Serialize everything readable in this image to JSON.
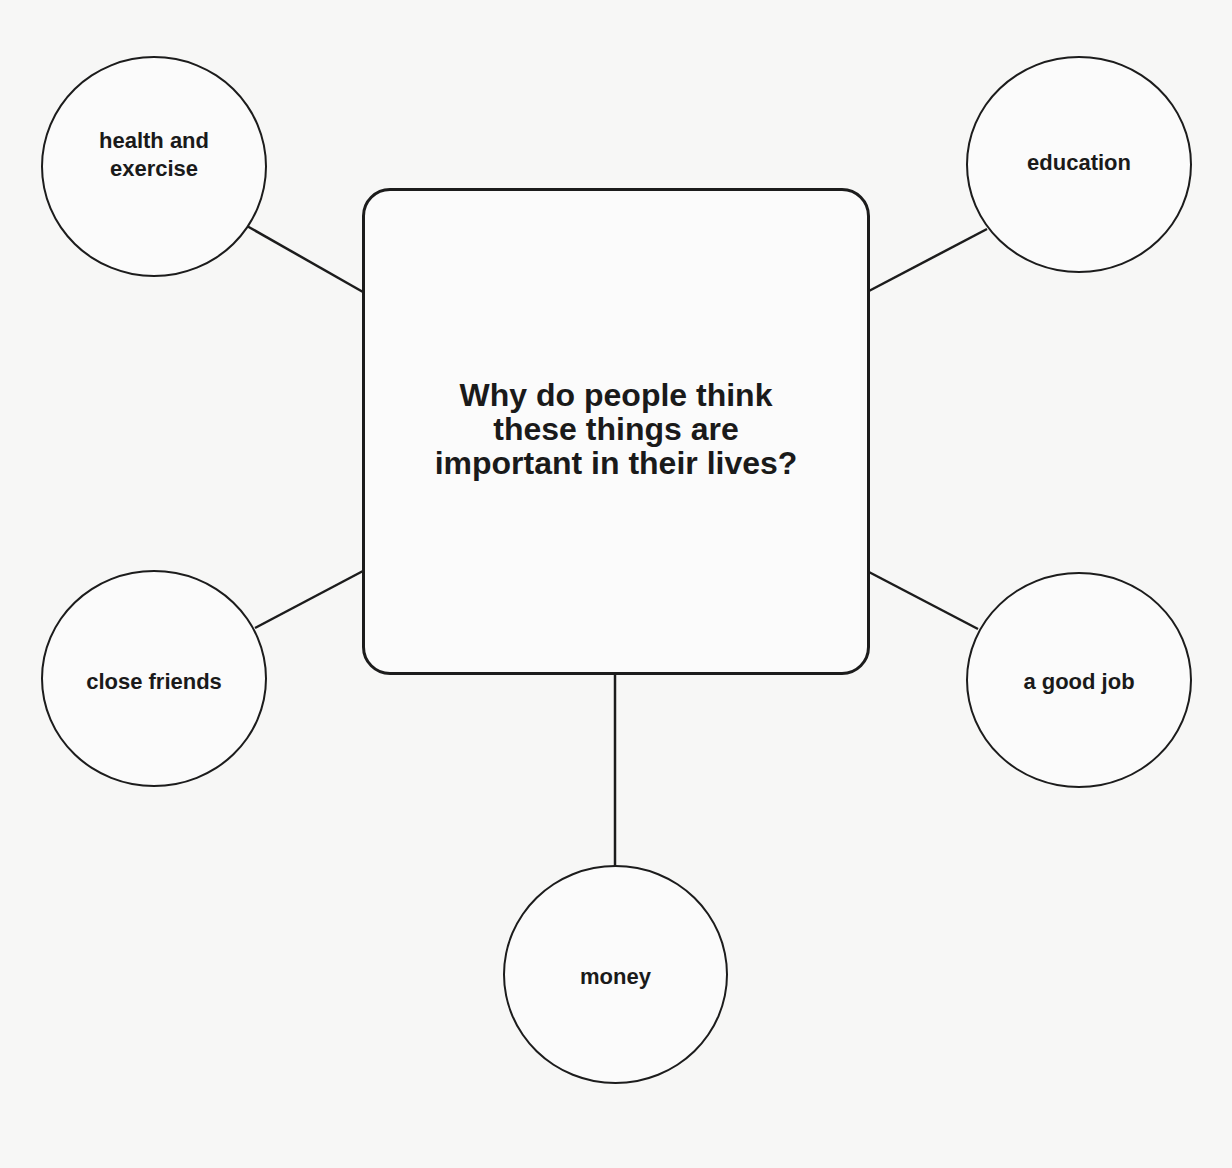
{
  "diagram": {
    "type": "mind-map",
    "center": {
      "text": "Why do people think these things are important in their lives?",
      "lines": [
        "Why do people think",
        "these things are",
        "important in their lives?"
      ]
    },
    "nodes": [
      {
        "id": "health",
        "label": "health and exercise",
        "lines": [
          "health and",
          "exercise"
        ],
        "position": "top-left"
      },
      {
        "id": "education",
        "label": "education",
        "lines": [
          "education"
        ],
        "position": "top-right"
      },
      {
        "id": "friends",
        "label": "close friends",
        "lines": [
          "close friends"
        ],
        "position": "middle-left"
      },
      {
        "id": "job",
        "label": "a good job",
        "lines": [
          "a good job"
        ],
        "position": "middle-right"
      },
      {
        "id": "money",
        "label": "money",
        "lines": [
          "money"
        ],
        "position": "bottom-center"
      }
    ],
    "colors": {
      "stroke": "#1c1c1c",
      "text": "#1a1a1a",
      "background": "#f7f7f6"
    }
  }
}
